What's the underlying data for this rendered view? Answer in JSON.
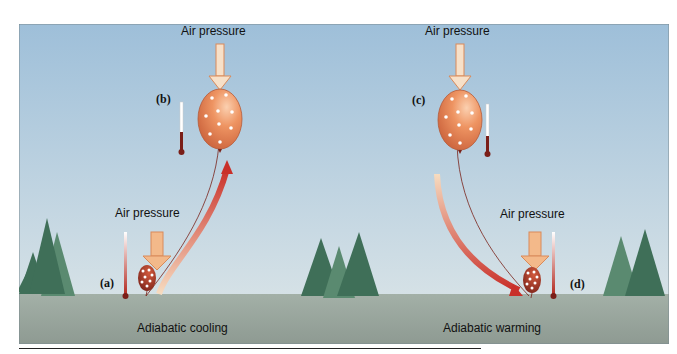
{
  "diagram": {
    "labels": {
      "air_pressure_b": "Air pressure",
      "air_pressure_c": "Air pressure",
      "air_pressure_a": "Air pressure",
      "air_pressure_d": "Air pressure",
      "cooling": "Adiabatic cooling",
      "warming": "Adiabatic warming",
      "a": "(a)",
      "b": "(b)",
      "c": "(c)",
      "d": "(d)"
    },
    "colors": {
      "sky_top": "#9ebfd9",
      "sky_bottom": "#d5e1e6",
      "ground": "#9eaaa3",
      "balloon_high": "#e88a5a",
      "balloon_low": "#b03a2a",
      "arrow_warm": "#d9412b",
      "arrow_cool": "#f2c7a0",
      "pressure_arrow": "#f3b98a",
      "tree": "#4a7d63"
    }
  }
}
